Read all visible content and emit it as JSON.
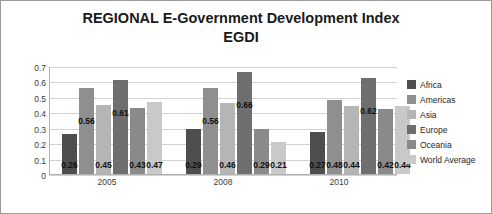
{
  "chart_data": {
    "type": "bar",
    "title": "REGIONAL E-Government Development Index EGDI",
    "title_line1": "REGIONAL E-Government Development Index",
    "title_line2": "EGDI",
    "xlabel": "",
    "ylabel": "",
    "ylim": [
      0,
      0.7
    ],
    "yticks": [
      0,
      0.1,
      0.2,
      0.3,
      0.4,
      0.5,
      0.6,
      0.7
    ],
    "ytick_labels": [
      "0",
      "0.1",
      "0.2",
      "0.3",
      "0.4",
      "0.5",
      "0.6",
      "0.7"
    ],
    "grid": true,
    "legend_position": "right",
    "categories": [
      "2005",
      "2008",
      "2010"
    ],
    "series": [
      {
        "name": "Africa",
        "color": "#4e4e4e",
        "values": [
          0.26,
          0.29,
          0.27
        ],
        "labels": [
          "0.26",
          "0.29",
          "0.27"
        ]
      },
      {
        "name": "Americas",
        "color": "#8f8f8f",
        "values": [
          0.56,
          0.56,
          0.48
        ],
        "labels": [
          "0.56",
          "0.56",
          "0.48"
        ]
      },
      {
        "name": "Asia",
        "color": "#b5b5b5",
        "values": [
          0.45,
          0.46,
          0.44
        ],
        "labels": [
          "0.45",
          "0.46",
          "0.44"
        ]
      },
      {
        "name": "Europe",
        "color": "#6e6e6e",
        "values": [
          0.61,
          0.66,
          0.62
        ],
        "labels": [
          "0.61",
          "0.66",
          "0.62"
        ]
      },
      {
        "name": "Oceania",
        "color": "#8a8a8a",
        "values": [
          0.43,
          0.29,
          0.42
        ],
        "labels": [
          "0.43",
          "0.29",
          "0.42"
        ]
      },
      {
        "name": "World Average",
        "color": "#c9c9c9",
        "values": [
          0.47,
          0.21,
          0.44
        ],
        "labels": [
          "0.47",
          "0.21",
          "0.44"
        ]
      }
    ]
  }
}
